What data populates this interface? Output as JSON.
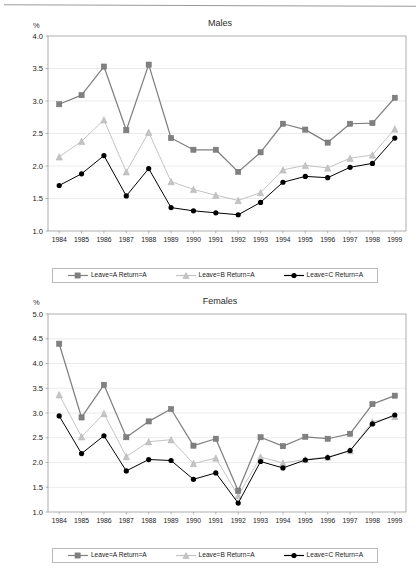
{
  "document": {
    "kind": "two-panel-line-chart-figure"
  },
  "series_styles": {
    "a_color": "#808080",
    "b_color": "#c4c4c4",
    "c_color": "#000000",
    "axis_color": "#9a9a9a",
    "grid_color": "#e2e2e2",
    "text_color": "#222222"
  },
  "legend": {
    "items": [
      {
        "label": "Leave=A Return=A",
        "marker": "square-marker",
        "color": "#808080"
      },
      {
        "label": "Leave=B Return=A",
        "marker": "triangle-marker",
        "color": "#c4c4c4"
      },
      {
        "label": "Leave=C Return=A",
        "marker": "circle-marker",
        "color": "#000000"
      }
    ]
  },
  "chart_data": [
    {
      "type": "line",
      "title": "Males",
      "xlabel": "",
      "ylabel": "%",
      "ylim": [
        1.0,
        4.0
      ],
      "yticks": [
        "1.0",
        "1.5",
        "2.0",
        "2.5",
        "3.0",
        "3.5",
        "4.0"
      ],
      "grid": true,
      "legend_position": "bottom",
      "categories": [
        "1984",
        "1985",
        "1986",
        "1987",
        "1988",
        "1989",
        "1990",
        "1991",
        "1992",
        "1993",
        "1994",
        "1995",
        "1996",
        "1997",
        "1998",
        "1999"
      ],
      "series": [
        {
          "name": "Leave=A Return=A",
          "marker": "square",
          "color": "#808080",
          "values": [
            2.95,
            3.09,
            3.53,
            2.55,
            3.56,
            2.43,
            2.25,
            2.25,
            1.91,
            2.21,
            2.65,
            2.56,
            2.36,
            2.65,
            2.66,
            3.05
          ]
        },
        {
          "name": "Leave=B Return=A",
          "marker": "triangle",
          "color": "#c4c4c4",
          "values": [
            2.14,
            2.38,
            2.71,
            1.91,
            2.52,
            1.76,
            1.64,
            1.55,
            1.47,
            1.59,
            1.94,
            2.01,
            1.97,
            2.12,
            2.17,
            2.57
          ]
        },
        {
          "name": "Leave=C Return=A",
          "marker": "circle",
          "color": "#000000",
          "values": [
            1.7,
            1.88,
            2.16,
            1.54,
            1.96,
            1.36,
            1.31,
            1.28,
            1.25,
            1.44,
            1.75,
            1.84,
            1.82,
            1.98,
            2.04,
            2.43
          ]
        }
      ]
    },
    {
      "type": "line",
      "title": "Females",
      "xlabel": "",
      "ylabel": "%",
      "ylim": [
        1.0,
        5.0
      ],
      "yticks": [
        "1.0",
        "1.5",
        "2.0",
        "2.5",
        "3.0",
        "3.5",
        "4.0",
        "4.5",
        "5.0"
      ],
      "grid": true,
      "legend_position": "bottom",
      "categories": [
        "1984",
        "1985",
        "1986",
        "1987",
        "1988",
        "1989",
        "1990",
        "1991",
        "1992",
        "1993",
        "1994",
        "1995",
        "1996",
        "1997",
        "1998",
        "1999"
      ],
      "series": [
        {
          "name": "Leave=A Return=A",
          "marker": "square",
          "color": "#808080",
          "values": [
            4.4,
            2.91,
            3.57,
            2.51,
            2.83,
            3.08,
            2.34,
            2.48,
            1.43,
            2.51,
            2.33,
            2.52,
            2.48,
            2.58,
            3.18,
            3.35
          ]
        },
        {
          "name": "Leave=B Return=A",
          "marker": "triangle",
          "color": "#c4c4c4",
          "values": [
            3.37,
            2.52,
            2.99,
            2.12,
            2.42,
            2.46,
            1.98,
            2.09,
            1.33,
            2.11,
            1.99,
            2.06,
            2.11,
            2.24,
            2.82,
            2.93
          ]
        },
        {
          "name": "Leave=C Return=A",
          "marker": "circle",
          "color": "#000000",
          "values": [
            2.94,
            2.18,
            2.54,
            1.83,
            2.06,
            2.04,
            1.66,
            1.79,
            1.18,
            2.02,
            1.89,
            2.05,
            2.1,
            2.24,
            2.78,
            2.96
          ]
        }
      ]
    }
  ]
}
